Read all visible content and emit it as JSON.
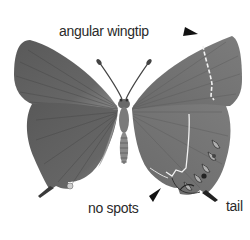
{
  "figure": {
    "view": "upperside left wings, underside right wings",
    "colors": {
      "wing_dark": "#5a5a5a",
      "wing_mid": "#7a7a7a",
      "wing_light": "#9a9a9a",
      "white_line": "#f2f2f2",
      "arrow": "#111111",
      "background": "#ffffff",
      "text": "#2a2a2a"
    }
  },
  "annotations": [
    {
      "id": "wingtip",
      "label": "angular wingtip",
      "pointer": "arrowhead"
    },
    {
      "id": "nospots",
      "label": "no spots",
      "pointer": "arrowhead"
    },
    {
      "id": "tail",
      "label": "tail",
      "pointer": "none"
    }
  ]
}
